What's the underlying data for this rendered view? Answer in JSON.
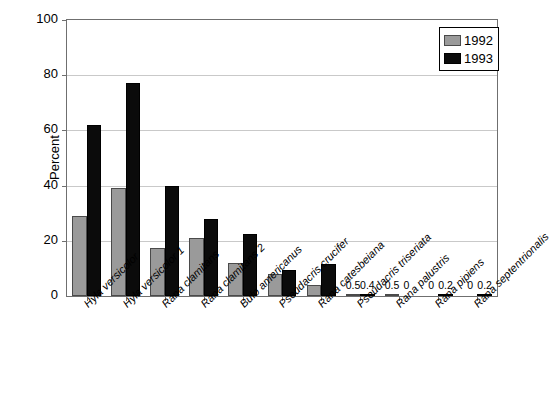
{
  "chart_data": {
    "type": "bar",
    "title": "",
    "xlabel": "",
    "ylabel": "Percent",
    "ylim": [
      0,
      100
    ],
    "yticks": [
      0,
      20,
      40,
      60,
      80,
      100
    ],
    "grid": true,
    "legend_position": "top-right",
    "categories": [
      "Hyla versicolor",
      "Hyla versicolor 1",
      "Rana clamitans",
      "Rana clamitans 2",
      "Bufo americanus",
      "Pseudacris crucifer",
      "Rana catesbeiana",
      "Pseudacris triseriata",
      "Rana palustris",
      "Rana pipiens",
      "Rana septentrionalis"
    ],
    "series": [
      {
        "name": "1992",
        "color": "#9a9a9a",
        "values": [
          29,
          39,
          17.5,
          21,
          12,
          8,
          4,
          0.5,
          0.5,
          0,
          0
        ]
      },
      {
        "name": "1993",
        "color": "#0b0b0b",
        "values": [
          62,
          77,
          40,
          28,
          22.5,
          9.5,
          11.5,
          0.4,
          0,
          0.2,
          0.2
        ]
      }
    ],
    "point_labels": {
      "Pseudacris triseriata": [
        "0.5",
        "0.4"
      ],
      "Rana palustris": [
        "0.5",
        "0"
      ],
      "Rana pipiens": [
        "0",
        "0.2"
      ],
      "Rana septentrionalis": [
        "0",
        "0.2"
      ]
    },
    "value_label_row": [
      "0.5",
      "0.4",
      "0.5",
      "0",
      "0",
      "0.2",
      "0",
      "0.2"
    ]
  },
  "legend": {
    "items": [
      {
        "label": "1992",
        "color": "#9a9a9a"
      },
      {
        "label": "1993",
        "color": "#0b0b0b"
      }
    ]
  }
}
